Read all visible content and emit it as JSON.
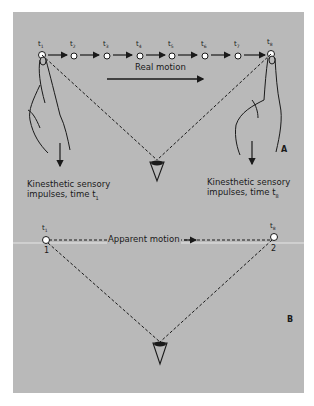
{
  "figure": {
    "panel_a": {
      "letter": "A",
      "time_labels": [
        "t1",
        "t2",
        "t3",
        "t4",
        "t5",
        "t6",
        "t7",
        "t8"
      ],
      "time_subscripts": [
        "1",
        "2",
        "3",
        "4",
        "5",
        "6",
        "7",
        "8"
      ],
      "motion_label": "Real motion",
      "left_caption_line1": "Kinesthetic sensory",
      "left_caption_line2": "impulses, time t",
      "left_caption_sub": "1",
      "right_caption_line1": "Kinesthetic sensory",
      "right_caption_line2": "impulses, time t",
      "right_caption_sub": "8"
    },
    "panel_b": {
      "letter": "B",
      "left_time_sub": "1",
      "right_time_sub": "8",
      "left_point_label": "1",
      "right_point_label": "2",
      "motion_label": "Apparent motion"
    },
    "colors": {
      "background": "#b9b9b9",
      "ink": "#1a1a1a",
      "point_fill": "#ffffff"
    }
  }
}
